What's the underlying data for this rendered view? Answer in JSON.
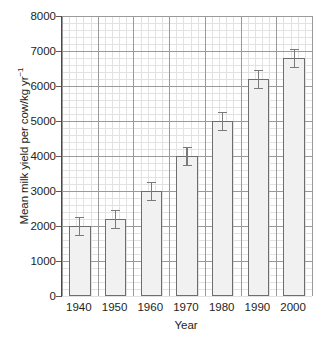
{
  "chart_data": {
    "type": "bar",
    "title": "",
    "subtitle": "",
    "xlabel": "Year",
    "ylabel": "Mean milk yield per cow/kg yr",
    "ylabel_superscript": "−1",
    "ylabel_full": "Mean milk yield per cow/kg yr⁻¹",
    "categories": [
      "1940",
      "1950",
      "1960",
      "1970",
      "1980",
      "1990",
      "2000"
    ],
    "values": [
      2000,
      2200,
      3000,
      4000,
      5000,
      6200,
      6800
    ],
    "errors": [
      250,
      250,
      250,
      250,
      250,
      250,
      250
    ],
    "error_type": "symmetric",
    "ylim": [
      0,
      8000
    ],
    "ytick_values": [
      0,
      1000,
      2000,
      3000,
      4000,
      5000,
      6000,
      7000,
      8000
    ],
    "ytick_labels": [
      "0",
      "1000",
      "2000",
      "3000",
      "4000",
      "5000",
      "6000",
      "7000",
      "8000"
    ],
    "xtick_labels": [
      "1940",
      "1950",
      "1960",
      "1970",
      "1980",
      "1990",
      "2000"
    ],
    "grid": "major-and-minor",
    "grid_minor_divisions": 5,
    "legend": "none",
    "legend_position": "none",
    "bar_fill_color": "#f1f1f1",
    "bar_edge_color": "#6e6e6e",
    "error_bar_color": "#7a7a7a",
    "axis_color": "#4a4a4a",
    "grid_major_color": "#9a9a9a",
    "grid_minor_color": "#e2e2e2",
    "text_color": "#231f20",
    "background_color": "#ffffff"
  }
}
